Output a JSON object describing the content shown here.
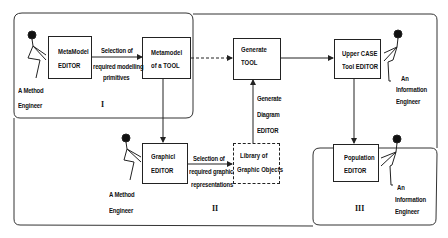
{
  "diagram": {
    "regions": [
      {
        "id": "I",
        "label": "I"
      },
      {
        "id": "II",
        "label": "II"
      },
      {
        "id": "III",
        "label": "III"
      }
    ],
    "boxes": {
      "metamodel_editor": {
        "line1": "MetaModel",
        "line2": "EDITOR"
      },
      "metamodel_tool": {
        "line1": "Metamodel",
        "line2": "of a  TOOL"
      },
      "generate_tool": {
        "line1": "Generate",
        "line2": "TOOL"
      },
      "upper_case": {
        "line1": "Upper CASE",
        "line2": "Tool EDITOR"
      },
      "graphic_editor": {
        "line1": "Graphicl",
        "line2": "EDITOR"
      },
      "library": {
        "line1": "Library of",
        "line2": "Graphic Objects"
      },
      "population_editor": {
        "line1": "Population",
        "line2": "EDITOR"
      }
    },
    "edge_labels": {
      "selection_primitives": [
        "Selection of",
        "required modelling",
        "primitives"
      ],
      "generate_diagram": [
        "Generate",
        "Diagram",
        "EDITOR"
      ],
      "selection_graphic": [
        "Selection of",
        "required graphic",
        "representations"
      ]
    },
    "actors": {
      "method_engineer_1": [
        "A Method",
        "Engineer"
      ],
      "method_engineer_2": [
        "A Method",
        "Engineer"
      ],
      "info_engineer_1": [
        "An",
        "Information",
        "Engineer"
      ],
      "info_engineer_2": [
        "An",
        "Information",
        "Engineer"
      ]
    },
    "colors": {
      "line": "#222222",
      "background": "#ffffff"
    }
  }
}
